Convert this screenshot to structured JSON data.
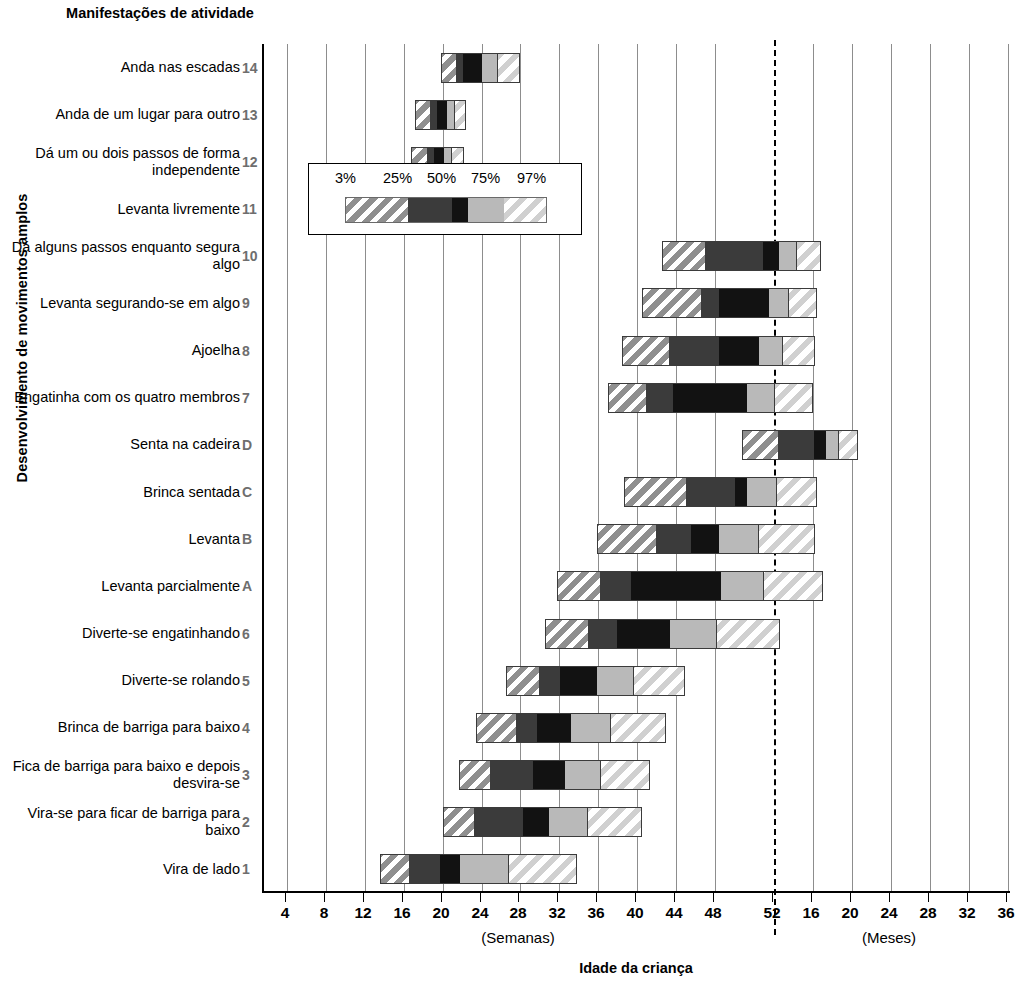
{
  "titles": {
    "y_axis": "Desenvolvimento de movimentos amplos",
    "column_header": "Manifestações de atividade",
    "x_axis": "Idade da criança",
    "unit_left": "(Semanas)",
    "unit_right": "(Meses)"
  },
  "legend": {
    "labels": [
      "3%",
      "25%",
      "50%",
      "75%",
      "97%"
    ]
  },
  "chart_data": {
    "type": "bar",
    "subtype": "percentile-range-bar",
    "title": "Manifestações de atividade",
    "xlabel": "Idade da criança",
    "ylabel": "Desenvolvimento de movimentos amplos",
    "grid": true,
    "legend_position": "inset-upper-left",
    "x_unit_left": "(Semanas)",
    "x_unit_right": "(Meses)",
    "x_tick_labels": [
      "4",
      "8",
      "12",
      "16",
      "20",
      "24",
      "28",
      "32",
      "36",
      "40",
      "44",
      "48",
      "52",
      "16",
      "20",
      "24",
      "28",
      "32",
      "36"
    ],
    "x_tick_positions_px": [
      285,
      324,
      363,
      402,
      441,
      480,
      518,
      557,
      596,
      635,
      674,
      713,
      772,
      811,
      850,
      889,
      928,
      967,
      1006
    ],
    "reference_line": {
      "label": "52",
      "note": "divisória semanas/meses",
      "style": "dashed"
    },
    "percentiles": [
      "3%",
      "25%",
      "50%",
      "75%",
      "97%"
    ],
    "rows": [
      {
        "code": "14",
        "label": "Anda nas escadas",
        "p3": 19.2,
        "p25": 20.6,
        "p50": 21.3,
        "p75": 23.2,
        "p97": 27.0
      },
      {
        "code": "13",
        "label": "Anda de um lugar para outro",
        "p3": 16.6,
        "p25": 18.1,
        "p50": 18.8,
        "p75": 19.8,
        "p97": 21.6
      },
      {
        "code": "12",
        "label": "Dá um ou dois passos de forma independente",
        "p3": 16.2,
        "p25": 17.8,
        "p50": 18.5,
        "p75": 19.5,
        "p97": 21.4
      },
      {
        "code": "11",
        "label": "Levanta livremente",
        "p3": 15.2,
        "p25": 17.5,
        "p50": 18.2,
        "p75": 19.2,
        "p97": 21.2
      },
      {
        "code": "10",
        "label": "Dá alguns passos enquanto segura algo",
        "p3": 41.0,
        "p25": 45.2,
        "p50": 51.0,
        "p75": 52.6,
        "p97": 16.8
      },
      {
        "code": "9",
        "label": "Levanta segurando-se em algo",
        "p3": 39.0,
        "p25": 44.8,
        "p50": 46.6,
        "p75": 51.6,
        "p97": 16.4
      },
      {
        "code": "8",
        "label": "Ajoelha",
        "p3": 37.0,
        "p25": 41.6,
        "p50": 46.6,
        "p75": 50.6,
        "p97": 16.2
      },
      {
        "code": "7",
        "label": "Engatinha com os quatro membros",
        "p3": 35.6,
        "p25": 39.4,
        "p50": 42.0,
        "p75": 49.4,
        "p97": 16.0
      },
      {
        "code": "D",
        "label": "Senta na cadeira",
        "p3": 48.8,
        "p25": 52.4,
        "p50": 16.2,
        "p75": 17.4,
        "p97": 20.6
      },
      {
        "code": "C",
        "label": "Brinca sentada",
        "p3": 37.2,
        "p25": 43.4,
        "p50": 48.2,
        "p75": 49.4,
        "p97": 16.4
      },
      {
        "code": "B",
        "label": "Levanta",
        "p3": 34.6,
        "p25": 40.4,
        "p50": 43.8,
        "p75": 46.6,
        "p97": 16.2
      },
      {
        "code": "A",
        "label": "Levanta parcialmente",
        "p3": 30.6,
        "p25": 34.8,
        "p50": 37.8,
        "p75": 46.8,
        "p97": 17.0
      },
      {
        "code": "6",
        "label": "Diverte-se engatinhando",
        "p3": 29.4,
        "p25": 33.6,
        "p50": 36.4,
        "p75": 41.8,
        "p97": 52.6
      },
      {
        "code": "5",
        "label": "Diverte-se rolando",
        "p3": 25.6,
        "p25": 28.8,
        "p50": 30.8,
        "p75": 34.6,
        "p97": 43.2
      },
      {
        "code": "4",
        "label": "Brinca de barriga para baixo",
        "p3": 22.6,
        "p25": 26.6,
        "p50": 28.6,
        "p75": 32.0,
        "p97": 41.4
      },
      {
        "code": "3",
        "label": "Fica de barriga para baixo e depois desvira-se",
        "p3": 21.0,
        "p25": 24.0,
        "p50": 28.2,
        "p75": 31.4,
        "p97": 39.8
      },
      {
        "code": "2",
        "label": "Vira-se para ficar de barriga para baixo",
        "p3": 19.4,
        "p25": 22.4,
        "p50": 27.2,
        "p75": 29.8,
        "p97": 39.0
      },
      {
        "code": "1",
        "label": "Vira de lado",
        "p3": 13.2,
        "p25": 16.0,
        "p50": 19.0,
        "p75": 21.0,
        "p97": 32.6
      }
    ]
  }
}
